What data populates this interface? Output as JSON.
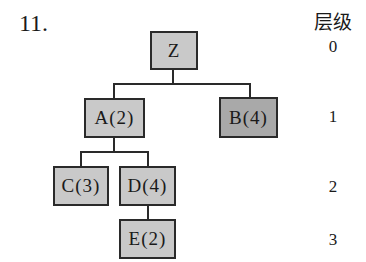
{
  "question_number": "11.",
  "level_header": "层级",
  "levels": [
    {
      "label": "0"
    },
    {
      "label": "1"
    },
    {
      "label": "2"
    },
    {
      "label": "3"
    }
  ],
  "tree": {
    "nodes": [
      {
        "id": "Z",
        "label": "Z",
        "level": 0,
        "shade": "#c9c9c9"
      },
      {
        "id": "A",
        "label": "A(2)",
        "level": 1,
        "shade": "#c9c9c9"
      },
      {
        "id": "B",
        "label": "B(4)",
        "level": 1,
        "shade": "#a9a9a9"
      },
      {
        "id": "C",
        "label": "C(3)",
        "level": 2,
        "shade": "#c9c9c9"
      },
      {
        "id": "D",
        "label": "D(4)",
        "level": 2,
        "shade": "#c9c9c9"
      },
      {
        "id": "E",
        "label": "E(2)",
        "level": 3,
        "shade": "#c9c9c9"
      }
    ],
    "edges": [
      {
        "from": "Z",
        "to": "A"
      },
      {
        "from": "Z",
        "to": "B"
      },
      {
        "from": "A",
        "to": "C"
      },
      {
        "from": "A",
        "to": "D"
      },
      {
        "from": "D",
        "to": "E"
      }
    ]
  }
}
